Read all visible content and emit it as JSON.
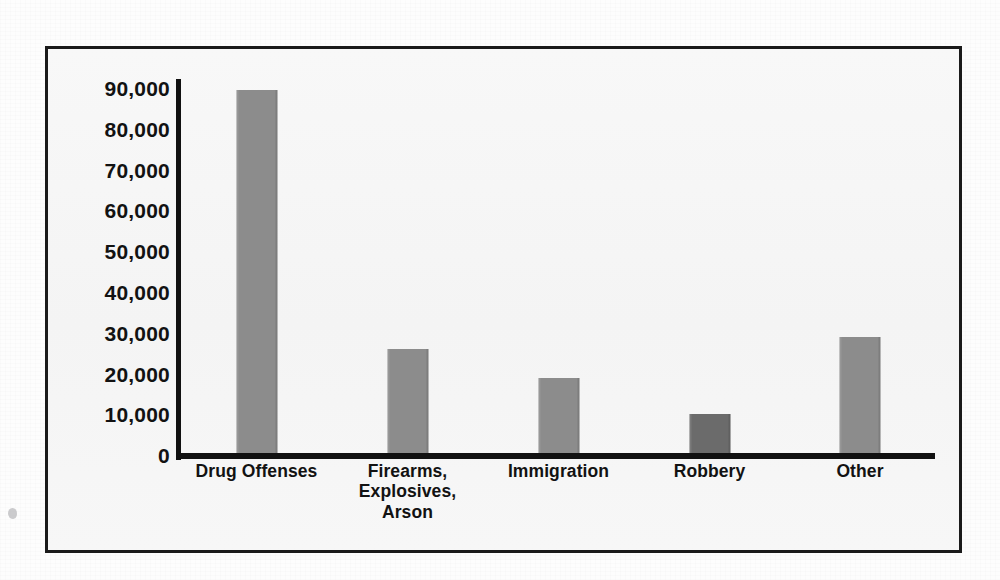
{
  "chart_data": {
    "type": "bar",
    "title": "",
    "xlabel": "",
    "ylabel": "",
    "categories": [
      "Drug Offenses",
      "Firearms,\nExplosives,\nArson",
      "Immigration",
      "Robbery",
      "Other"
    ],
    "values": [
      89500,
      26000,
      19000,
      10000,
      29000
    ],
    "ylim": [
      0,
      90000
    ],
    "ytick_labels": [
      "90,000",
      "80,000",
      "70,000",
      "60,000",
      "50,000",
      "40,000",
      "30,000",
      "20,000",
      "10,000",
      "0"
    ],
    "ytick_values": [
      90000,
      80000,
      70000,
      60000,
      50000,
      40000,
      30000,
      20000,
      10000,
      0
    ],
    "grid": false,
    "legend": "none",
    "bar_colors": [
      "#8c8c8c",
      "#8c8c8c",
      "#8c8c8c",
      "#6b6b6b",
      "#8c8c8c"
    ],
    "series": [
      {
        "name": "Offenders",
        "values": [
          89500,
          26000,
          19000,
          10000,
          29000
        ]
      }
    ]
  },
  "colors": {
    "axis": "#111111",
    "frame_border": "#1b1b1b",
    "plot_background": "#f7f7f7",
    "bar_default": "#8c8c8c",
    "bar_highlight": "#6b6b6b",
    "text": "#121212"
  }
}
